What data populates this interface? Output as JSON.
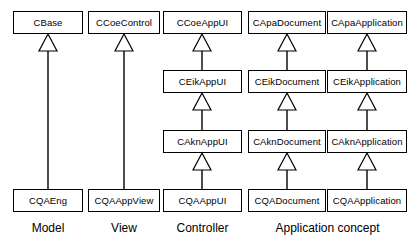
{
  "diagram": {
    "type": "uml-class-diagram",
    "background_color": "#ffffff",
    "line_color": "#000000",
    "box_fill_color": "#ffffff",
    "relationship": "generalization",
    "columns": [
      {
        "id": "model",
        "group_label": "Model",
        "boxes": [
          {
            "name": "CBase",
            "row": 1
          },
          {
            "name": "CQAEng",
            "row": 4
          }
        ]
      },
      {
        "id": "view",
        "group_label": "View",
        "boxes": [
          {
            "name": "CCoeControl",
            "row": 1
          },
          {
            "name": "CQAAppView",
            "row": 4
          }
        ]
      },
      {
        "id": "controller",
        "group_label": "Controller",
        "boxes": [
          {
            "name": "CCoeAppUI",
            "row": 1
          },
          {
            "name": "CEikAppUI",
            "row": 2
          },
          {
            "name": "CAknAppUI",
            "row": 3
          },
          {
            "name": "CQAAppUI",
            "row": 4
          }
        ]
      },
      {
        "id": "document",
        "group_label": "Application concept",
        "boxes": [
          {
            "name": "CApaDocument",
            "row": 1
          },
          {
            "name": "CEikDocument",
            "row": 2
          },
          {
            "name": "CAknDocument",
            "row": 3
          },
          {
            "name": "CQADocument",
            "row": 4
          }
        ]
      },
      {
        "id": "application",
        "group_label": "",
        "boxes": [
          {
            "name": "CApaApplication",
            "row": 1
          },
          {
            "name": "CEikApplication",
            "row": 2
          },
          {
            "name": "CAknApplication",
            "row": 3
          },
          {
            "name": "CQAApplication",
            "row": 4
          }
        ]
      }
    ],
    "group_labels": [
      {
        "id": "group-label-model",
        "text": "Model"
      },
      {
        "id": "group-label-view",
        "text": "View"
      },
      {
        "id": "group-label-controller",
        "text": "Controller"
      },
      {
        "id": "group-label-application-concept",
        "text": "Application concept"
      }
    ]
  },
  "layout": {
    "columns_px": [
      {
        "id": "model",
        "x": 13,
        "w": 70
      },
      {
        "id": "view",
        "x": 88,
        "w": 72
      },
      {
        "id": "controller",
        "x": 163,
        "w": 79
      },
      {
        "id": "document",
        "x": 248,
        "w": 78
      },
      {
        "id": "application",
        "x": 327,
        "w": 80
      }
    ],
    "rows_px": [
      {
        "row": 1,
        "y": 11,
        "h": 23
      },
      {
        "row": 2,
        "y": 70,
        "h": 23
      },
      {
        "row": 3,
        "y": 130,
        "h": 23
      },
      {
        "row": 4,
        "y": 189,
        "h": 23
      }
    ],
    "group_labels_px": [
      {
        "id": "group-label-model",
        "x": 13,
        "w": 70,
        "y": 222
      },
      {
        "id": "group-label-view",
        "x": 88,
        "w": 72,
        "y": 222
      },
      {
        "id": "group-label-controller",
        "x": 163,
        "w": 79,
        "y": 222
      },
      {
        "id": "group-label-application-concept",
        "x": 248,
        "w": 159,
        "y": 222
      }
    ],
    "edges": [
      {
        "id": "edge-cbase-cqaeng",
        "cx": 48,
        "from_y": 34,
        "to_y": 189
      },
      {
        "id": "edge-ccoecontrol-cqaappview",
        "cx": 124,
        "from_y": 34,
        "to_y": 189
      },
      {
        "id": "edge-ccoeappui-ceikappui",
        "cx": 202,
        "from_y": 34,
        "to_y": 70
      },
      {
        "id": "edge-ceikappui-caknappui",
        "cx": 202,
        "from_y": 93,
        "to_y": 130
      },
      {
        "id": "edge-caknappui-cqaappui",
        "cx": 202,
        "from_y": 153,
        "to_y": 189
      },
      {
        "id": "edge-capadocument-ceikdocument",
        "cx": 287,
        "from_y": 34,
        "to_y": 70
      },
      {
        "id": "edge-ceikdocument-cakndocument",
        "cx": 287,
        "from_y": 93,
        "to_y": 130
      },
      {
        "id": "edge-cakndocument-cqadocument",
        "cx": 287,
        "from_y": 153,
        "to_y": 189
      },
      {
        "id": "edge-capaapplication-ceikapplication",
        "cx": 367,
        "from_y": 34,
        "to_y": 70
      },
      {
        "id": "edge-ceikapplication-caknapplication",
        "cx": 367,
        "from_y": 93,
        "to_y": 130
      },
      {
        "id": "edge-caknapplication-cqaapplication",
        "cx": 367,
        "from_y": 153,
        "to_y": 189
      }
    ],
    "arrow": {
      "half_width": 9,
      "height": 17
    }
  }
}
